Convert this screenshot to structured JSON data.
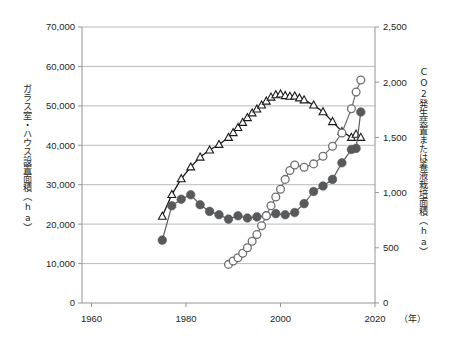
{
  "chart_data": {
    "type": "line",
    "title": "",
    "xlabel": "（年）",
    "x_unit_label": "（年）",
    "x_ticks": [
      1960,
      1980,
      2000,
      2020
    ],
    "x_tick_labels": [
      "1960",
      "1980",
      "2000",
      "2020"
    ],
    "xlim": [
      1958,
      2020
    ],
    "grid": true,
    "legend_position": "none",
    "axes": [
      {
        "id": "left",
        "label": "ガラス室・ハウス設置面積（ha）",
        "label_main": "ガラス室・ハウス設置面積",
        "label_unit": "（ha）",
        "ylim": [
          0,
          70000
        ],
        "ticks": [
          0,
          10000,
          20000,
          30000,
          40000,
          50000,
          60000,
          70000
        ],
        "tick_labels": [
          "0",
          "10,000",
          "20,000",
          "30,000",
          "40,000",
          "50,000",
          "60,000",
          "70,000"
        ]
      },
      {
        "id": "right",
        "label": "CO2発生装置または養液栽培面積（ha）",
        "label_main_a": "CO",
        "label_main_sub": "2",
        "label_main_b": "発生装置または養液栽培面積",
        "label_unit": "（ha）",
        "ylim": [
          0,
          2500
        ],
        "ticks": [
          0,
          500,
          1000,
          1500,
          2000,
          2500
        ],
        "tick_labels": [
          "0",
          "500",
          "1,000",
          "1,500",
          "2,000",
          "2,500"
        ]
      }
    ],
    "series": [
      {
        "name": "ガラス室・ハウス設置面積",
        "marker": "open-triangle",
        "axis": "left",
        "color": "#1a1a1a",
        "x": [
          1975,
          1977,
          1979,
          1981,
          1983,
          1985,
          1987,
          1989,
          1990,
          1991,
          1992,
          1993,
          1994,
          1995,
          1996,
          1997,
          1998,
          1999,
          2000,
          2001,
          2002,
          2003,
          2004,
          2005,
          2007,
          2009,
          2011,
          2013,
          2015,
          2016,
          2017
        ],
        "values": [
          22000,
          27500,
          31500,
          34500,
          37000,
          38800,
          40200,
          42000,
          43200,
          44500,
          45800,
          47000,
          48200,
          49200,
          50200,
          51200,
          52200,
          52800,
          53000,
          52600,
          52400,
          52500,
          52000,
          51500,
          50200,
          48500,
          46000,
          43500,
          42000,
          42800,
          42000
        ]
      },
      {
        "name": "CO2発生装置設置面積",
        "marker": "filled-circle",
        "axis": "right",
        "color": "#58595b",
        "x": [
          1975,
          1977,
          1979,
          1981,
          1983,
          1985,
          1987,
          1989,
          1991,
          1993,
          1995,
          1997,
          1999,
          2001,
          2003,
          2005,
          2007,
          2009,
          2011,
          2013,
          2015,
          2016,
          2017
        ],
        "values": [
          570,
          880,
          940,
          980,
          890,
          830,
          800,
          760,
          790,
          770,
          780,
          790,
          810,
          800,
          820,
          900,
          1010,
          1060,
          1120,
          1270,
          1390,
          1400,
          1730
        ]
      },
      {
        "name": "養液栽培面積",
        "marker": "open-circle",
        "axis": "right",
        "color": "#6d6e71",
        "x": [
          1989,
          1990,
          1991,
          1992,
          1993,
          1994,
          1995,
          1996,
          1997,
          1998,
          1999,
          2000,
          2001,
          2002,
          2003,
          2005,
          2007,
          2009,
          2011,
          2013,
          2015,
          2016,
          2017
        ],
        "values": [
          350,
          380,
          410,
          450,
          500,
          560,
          620,
          700,
          790,
          880,
          960,
          1030,
          1120,
          1200,
          1250,
          1230,
          1260,
          1330,
          1420,
          1540,
          1760,
          1910,
          2020
        ]
      }
    ]
  }
}
